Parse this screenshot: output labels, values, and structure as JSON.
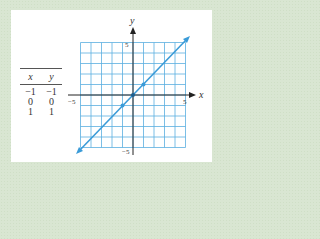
{
  "table": {
    "headers": [
      "x",
      "y"
    ],
    "rows": [
      [
        "−1",
        "−1"
      ],
      [
        "0",
        "0"
      ],
      [
        "1",
        "1"
      ]
    ]
  },
  "axes": {
    "x_label": "x",
    "y_label": "y",
    "x_min_label": "−5",
    "x_max_label": "5",
    "y_max_label": "5",
    "y_min_label": "−5"
  },
  "colors": {
    "grid": "#5aaee0",
    "line": "#3a9bd8",
    "axis": "#222222",
    "background": "#d9e6d2"
  },
  "chart_data": {
    "type": "line",
    "title": "",
    "xlabel": "x",
    "ylabel": "y",
    "xlim": [
      -5,
      5
    ],
    "ylim": [
      -5,
      5
    ],
    "grid": true,
    "series": [
      {
        "name": "y = x",
        "x": [
          -5,
          5
        ],
        "y": [
          -5,
          5
        ]
      }
    ],
    "points": [
      {
        "x": -1,
        "y": -1
      },
      {
        "x": 0,
        "y": 0
      },
      {
        "x": 1,
        "y": 1
      }
    ],
    "table": {
      "columns": [
        "x",
        "y"
      ],
      "rows": [
        [
          -1,
          -1
        ],
        [
          0,
          0
        ],
        [
          1,
          1
        ]
      ]
    }
  }
}
